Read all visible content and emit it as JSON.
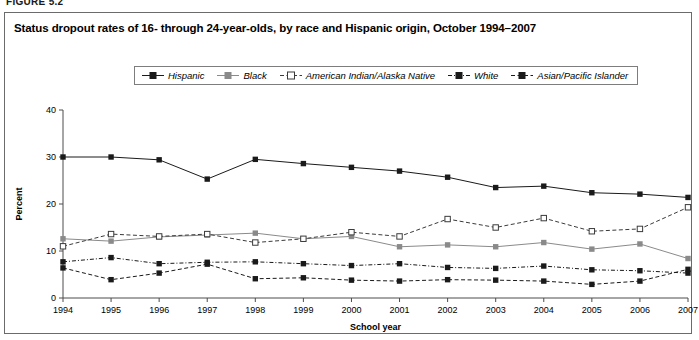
{
  "figure_label": "FIGURE 5.2",
  "chart_title": "Status dropout rates of 16- through 24-year-olds, by race and Hispanic origin, October 1994–2007",
  "legend": {
    "position": "top-center",
    "entries": [
      {
        "label": "Hispanic",
        "color": "#1a1a1a",
        "marker": "filled-square",
        "dash": "none"
      },
      {
        "label": "Black",
        "color": "#8a8a8a",
        "marker": "filled-square",
        "dash": "none"
      },
      {
        "label": "American Indian/Alaska Native",
        "color": "#3b3b3b",
        "marker": "hollow-square",
        "dash": "dashed"
      },
      {
        "label": "White",
        "color": "#1a1a1a",
        "marker": "filled-square",
        "dash": "dash-dot"
      },
      {
        "label": "Asian/Pacific Islander",
        "color": "#1a1a1a",
        "marker": "filled-square",
        "dash": "dashed"
      }
    ]
  },
  "chart_data": {
    "type": "line",
    "title": "Status dropout rates of 16- through 24-year-olds, by race and Hispanic origin, October 1994–2007",
    "xlabel": "School year",
    "ylabel": "Percent",
    "grid": false,
    "ylim": [
      0,
      40
    ],
    "yticks": [
      0,
      10,
      20,
      30,
      40
    ],
    "ytick_labels": [
      "0",
      "10",
      "20",
      "30",
      "40"
    ],
    "x": [
      1994,
      1995,
      1996,
      1997,
      1998,
      1999,
      2000,
      2001,
      2002,
      2003,
      2004,
      2005,
      2006,
      2007
    ],
    "xtick_labels": [
      "1994",
      "1995",
      "1996",
      "1997",
      "1998",
      "1999",
      "2000",
      "2001",
      "2002",
      "2003",
      "2004",
      "2005",
      "2006",
      "2007"
    ],
    "series": [
      {
        "name": "Hispanic",
        "color": "#1a1a1a",
        "marker": "filled-square",
        "dash": "none",
        "values": [
          30.0,
          30.0,
          29.4,
          25.3,
          29.5,
          28.6,
          27.8,
          27.0,
          25.7,
          23.5,
          23.8,
          22.4,
          22.1,
          21.4
        ]
      },
      {
        "name": "Black",
        "color": "#8a8a8a",
        "marker": "filled-square",
        "dash": "none",
        "values": [
          12.6,
          12.1,
          13.0,
          13.4,
          13.8,
          12.6,
          13.1,
          10.9,
          11.3,
          10.9,
          11.8,
          10.4,
          11.5,
          8.4
        ]
      },
      {
        "name": "American Indian/Alaska Native",
        "color": "#3b3b3b",
        "marker": "hollow-square",
        "dash": "dashed",
        "values": [
          11.0,
          13.6,
          13.1,
          13.6,
          11.8,
          12.6,
          14.0,
          13.1,
          16.8,
          15.0,
          17.0,
          14.2,
          14.7,
          19.3
        ]
      },
      {
        "name": "White",
        "color": "#1a1a1a",
        "marker": "filled-square",
        "dash": "dash-dot",
        "values": [
          7.7,
          8.6,
          7.3,
          7.6,
          7.7,
          7.3,
          6.9,
          7.3,
          6.5,
          6.3,
          6.8,
          6.0,
          5.8,
          5.3
        ]
      },
      {
        "name": "Asian/Pacific Islander",
        "color": "#1a1a1a",
        "marker": "filled-square",
        "dash": "dashed",
        "values": [
          6.4,
          3.9,
          5.3,
          7.2,
          4.1,
          4.3,
          3.8,
          3.6,
          3.9,
          3.8,
          3.6,
          2.9,
          3.6,
          6.1
        ]
      }
    ]
  }
}
